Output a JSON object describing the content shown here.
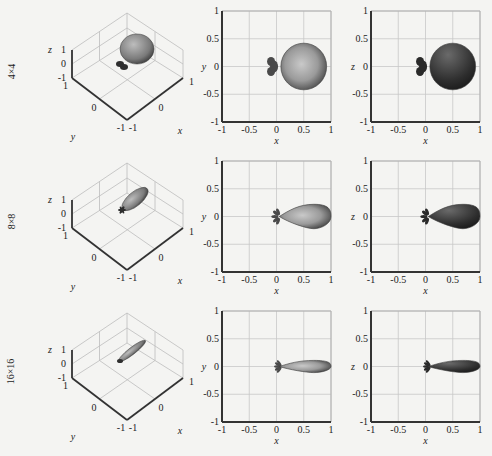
{
  "chart_data": {
    "type": "figure-grid",
    "rows": [
      {
        "label": "4×4",
        "main_lobe": {
          "center_x": 0.5,
          "half_width_x": 0.42,
          "half_width_y": 0.42
        },
        "back_lobe_x": -0.1
      },
      {
        "label": "8×8",
        "main_lobe": {
          "center_x": 0.55,
          "half_width_x": 0.45,
          "half_width_y": 0.22
        },
        "back_lobe_x": -0.05
      },
      {
        "label": "16×16",
        "main_lobe": {
          "center_x": 0.55,
          "half_width_x": 0.45,
          "half_width_y": 0.11
        },
        "back_lobe_x": 0.0
      }
    ],
    "panels": {
      "view3d": {
        "xlabel": "x",
        "ylabel": "y",
        "zlabel": "z",
        "x_ticks": [
          "-1",
          "0",
          "1"
        ],
        "y_ticks": [
          "1",
          "0",
          "-1"
        ],
        "z_ticks": [
          "1",
          "0",
          "-1"
        ]
      },
      "xy": {
        "xlabel": "x",
        "ylabel": "y",
        "xlim": [
          -1,
          1
        ],
        "ylim": [
          -1,
          1
        ],
        "x_ticks": [
          "-1",
          "-0.5",
          "0",
          "0.5",
          "1"
        ],
        "y_ticks": [
          "1",
          "0.5",
          "0",
          "-0.5",
          "-1"
        ],
        "grid": true
      },
      "xz": {
        "xlabel": "x",
        "ylabel": "z",
        "xlim": [
          -1,
          1
        ],
        "ylim": [
          -1,
          1
        ],
        "x_ticks": [
          "-1",
          "-0.5",
          "0",
          "0.5",
          "1"
        ],
        "y_ticks": [
          "1",
          "0.5",
          "0",
          "-0.5",
          "-1"
        ],
        "grid": true
      }
    },
    "colors": {
      "xy_fill": "#8a8a8a",
      "xz_fill": "#3a3a3a",
      "grid": "#c8c8c8",
      "axis": "#333333"
    }
  },
  "labels": {
    "row1": "4×4",
    "row2": "8×8",
    "row3": "16×16"
  }
}
